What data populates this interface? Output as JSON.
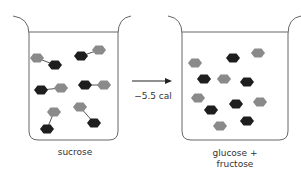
{
  "diagram": {
    "left_beaker": {
      "label": "sucrose",
      "molecules": [
        {
          "a": {
            "x": 37,
            "y": 58,
            "c": "gray"
          },
          "b": {
            "x": 55,
            "y": 65,
            "c": "black"
          }
        },
        {
          "a": {
            "x": 81,
            "y": 56,
            "c": "black"
          },
          "b": {
            "x": 99,
            "y": 50,
            "c": "gray"
          }
        },
        {
          "a": {
            "x": 41,
            "y": 90,
            "c": "black"
          },
          "b": {
            "x": 61,
            "y": 88,
            "c": "gray"
          }
        },
        {
          "a": {
            "x": 85,
            "y": 85,
            "c": "black"
          },
          "b": {
            "x": 104,
            "y": 85,
            "c": "gray"
          }
        },
        {
          "a": {
            "x": 54,
            "y": 112,
            "c": "gray"
          },
          "b": {
            "x": 47,
            "y": 129,
            "c": "black"
          }
        },
        {
          "a": {
            "x": 80,
            "y": 107,
            "c": "gray"
          },
          "b": {
            "x": 94,
            "y": 123,
            "c": "black"
          }
        }
      ]
    },
    "arrow": {
      "label": "−5.5 cal"
    },
    "right_beaker": {
      "label_line1": "glucose +",
      "label_line2": "fructose",
      "molecules": [
        {
          "x": 195,
          "y": 63,
          "c": "gray"
        },
        {
          "x": 233,
          "y": 58,
          "c": "black"
        },
        {
          "x": 258,
          "y": 53,
          "c": "gray"
        },
        {
          "x": 204,
          "y": 79,
          "c": "black"
        },
        {
          "x": 224,
          "y": 79,
          "c": "gray"
        },
        {
          "x": 247,
          "y": 82,
          "c": "black"
        },
        {
          "x": 198,
          "y": 98,
          "c": "gray"
        },
        {
          "x": 211,
          "y": 110,
          "c": "black"
        },
        {
          "x": 236,
          "y": 104,
          "c": "black"
        },
        {
          "x": 260,
          "y": 102,
          "c": "gray"
        },
        {
          "x": 220,
          "y": 126,
          "c": "gray"
        },
        {
          "x": 247,
          "y": 121,
          "c": "black"
        }
      ]
    },
    "colors": {
      "gray": "#8a8a8a",
      "black": "#1e1e1e",
      "line": "#666666"
    }
  }
}
